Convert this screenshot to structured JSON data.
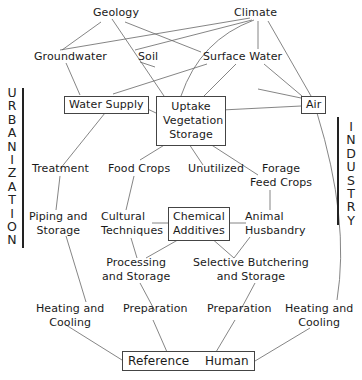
{
  "diagram": {
    "nodes": {
      "geology": "Geology",
      "climate": "Climate",
      "groundwater": "Groundwater",
      "soil": "Soil",
      "surface_water": "Surface Water",
      "water_supply": "Water Supply",
      "uptake_1": "Uptake",
      "uptake_2": "Vegetation",
      "uptake_3": "Storage",
      "air": "Air",
      "treatment": "Treatment",
      "food_crops": "Food Crops",
      "unutilized": "Unutilized",
      "forage_1": "Forage",
      "forage_2": "Feed Crops",
      "piping_1": "Piping and",
      "piping_2": "Storage",
      "cultural_1": "Cultural",
      "cultural_2": "Techniques",
      "chemical_1": "Chemical",
      "chemical_2": "Additives",
      "animal_1": "Animal",
      "animal_2": "Husbandry",
      "processing_1": "Processing",
      "processing_2": "and Storage",
      "butchering_1": "Selective Butchering",
      "butchering_2": "and Storage",
      "heating_left_1": "Heating and",
      "heating_left_2": "Cooling",
      "prep_left": "Preparation",
      "prep_right": "Preparation",
      "heating_right_1": "Heating and",
      "heating_right_2": "Cooling",
      "reference_human": "Reference    Human"
    },
    "side_labels": {
      "left": "U\nR\nB\nA\nN\nI\nZ\nA\nT\nI\nO\nN",
      "right": "I\nN\nD\nU\nS\nT\nR\nY"
    },
    "colors": {
      "line": "#555555",
      "text": "#1a1a1a",
      "background": "#ffffff"
    }
  }
}
